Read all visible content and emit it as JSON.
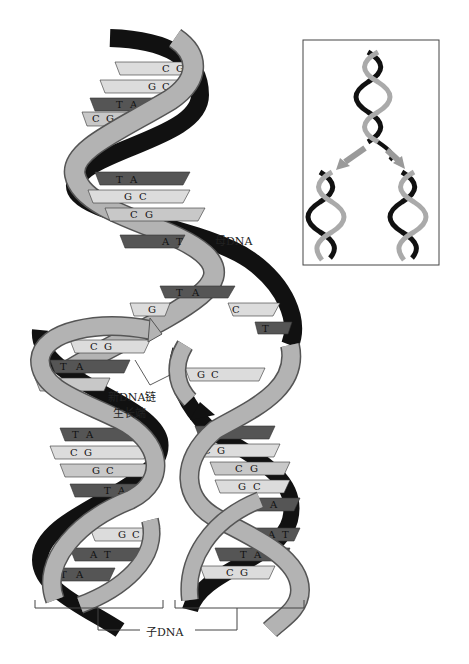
{
  "diagram": {
    "labels": {
      "parent_dna": "母DNA",
      "growth_end_line1": "新DNA链",
      "growth_end_line2": "生长端",
      "daughter_dna": "子DNA"
    },
    "parent_base_pairs": [
      [
        "C",
        "G"
      ],
      [
        "G",
        "C"
      ],
      [
        "T",
        "A"
      ],
      [
        "C",
        "G"
      ],
      [
        "T",
        "A"
      ],
      [
        "G",
        "C"
      ],
      [
        "C",
        "G"
      ],
      [
        "A",
        "T"
      ],
      [
        "T",
        "A"
      ]
    ],
    "unpaired_bases_parent_right": [
      "C",
      "T"
    ],
    "left_daughter_base_pairs": [
      [
        "G"
      ],
      [
        "A"
      ],
      [
        "C",
        "G"
      ],
      [
        "T",
        "A"
      ],
      [
        "C",
        "G"
      ],
      [
        "T",
        "A"
      ],
      [
        "C",
        "G"
      ],
      [
        "G",
        "C"
      ],
      [
        "T",
        "A"
      ],
      [
        "G",
        "C"
      ],
      [
        "A",
        "T"
      ],
      [
        "T",
        "A"
      ]
    ],
    "right_daughter_base_pairs": [
      [
        "G",
        "C"
      ],
      [
        "A",
        "T"
      ],
      [
        "C",
        "G"
      ],
      [
        "C",
        "G"
      ],
      [
        "G",
        "C"
      ],
      [
        "A"
      ],
      [
        "A",
        "T"
      ],
      [
        "T",
        "A"
      ],
      [
        "C",
        "G"
      ]
    ],
    "inset": {
      "description": "Overview: one helix splitting into two daughter helices",
      "arrows": 2
    },
    "colors": {
      "backbone_light": "#b3b3b3",
      "backbone_dark": "#111111",
      "base_dark": "#555555",
      "base_mid": "#8a8a8a",
      "base_light": "#dcdcdc",
      "arrow": "#9a9a9a"
    }
  }
}
